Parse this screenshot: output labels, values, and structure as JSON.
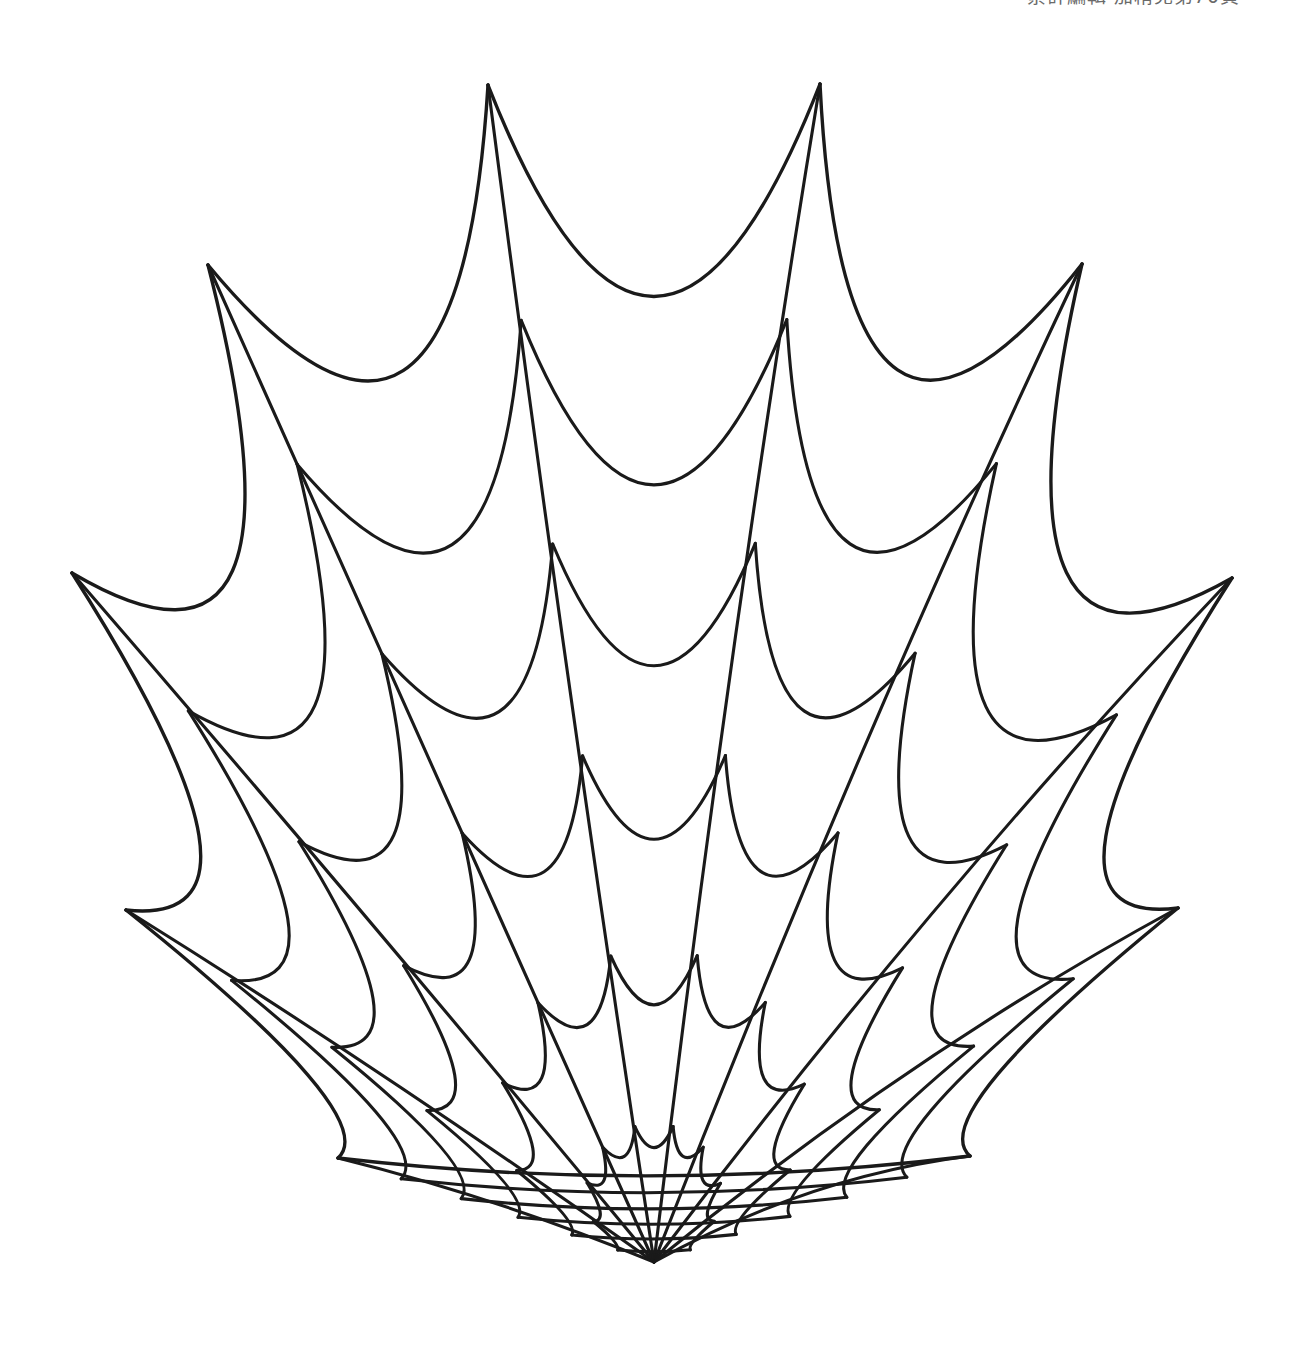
{
  "page": {
    "width": 1308,
    "height": 1350,
    "background_color": "#ffffff",
    "header_text": "累計編輯·加精兒第70頁",
    "header_text_color": "#6a6a6a"
  },
  "artwork": {
    "title": "spider-web-rosette",
    "description": "Hand-drawn concentric scalloped spider web with ten radial spokes converging to a single cusp at the bottom.",
    "stroke_color": "#1a1a1a",
    "fill_color": "none",
    "stroke_width_outer": 3.4,
    "stroke_width_inner": 3.1,
    "center": {
      "x": 654,
      "y": 1262
    },
    "apex_x": 654,
    "spoke_count": 10,
    "ring_count": 5,
    "extent": {
      "left_tip_x": 72,
      "right_tip_x": 1232,
      "top_peak_y": 84,
      "bottom_vertex_y": 1262,
      "left_tip_y": 573,
      "right_tip_y": 578
    },
    "outer_tips": [
      {
        "name": "top-left-peak",
        "x": 488,
        "y": 85
      },
      {
        "name": "top-right-peak",
        "x": 820,
        "y": 84
      },
      {
        "name": "upper-left-tip",
        "x": 208,
        "y": 265
      },
      {
        "name": "upper-right-tip",
        "x": 1082,
        "y": 264
      },
      {
        "name": "left-tip",
        "x": 72,
        "y": 573
      },
      {
        "name": "right-tip",
        "x": 1232,
        "y": 578
      },
      {
        "name": "lower-left-tip",
        "x": 126,
        "y": 910
      },
      {
        "name": "lower-right-tip",
        "x": 1178,
        "y": 908
      },
      {
        "name": "bottom-left-tip",
        "x": 338,
        "y": 1158
      },
      {
        "name": "bottom-right-tip",
        "x": 970,
        "y": 1156
      }
    ],
    "ring_cusp_y_on_center_axis": [
      185,
      400,
      625,
      855,
      1040
    ],
    "spoke_angles_degrees": [
      270,
      306,
      342,
      18,
      54,
      90,
      126,
      162,
      198,
      234
    ],
    "ring_radii_fraction": [
      1.0,
      0.8,
      0.61,
      0.43,
      0.26,
      0.115
    ],
    "geometry_notes": {
      "spokes": "Each spoke is a gentle arc, bowed so that near the bottom vertex many spokes stack into a dense black fan.",
      "rings": "Each ring segment is an arc bowing inward (toward the center) between adjacent spokes, producing scalloped cusps."
    }
  }
}
